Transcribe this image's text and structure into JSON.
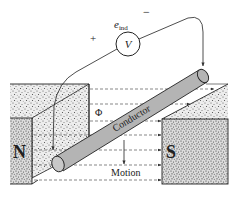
{
  "diagram": {
    "labels": {
      "emf": "e",
      "emf_subscript": "ind",
      "voltmeter": "V",
      "plus": "+",
      "minus": "−",
      "flux": "Φ",
      "conductor": "Conductor",
      "motion": "Motion",
      "north_pole": "N",
      "south_pole": "S"
    },
    "flux_lines_count": 7,
    "colors": {
      "line": "#222222",
      "conductor_fill": "#b4b4b4",
      "magnet_fill": "#e6e6e6",
      "stipple": "#5a5a5a",
      "background": "#ffffff"
    }
  }
}
